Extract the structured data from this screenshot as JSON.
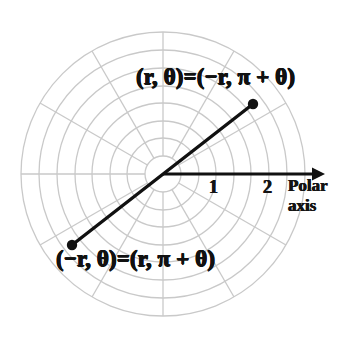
{
  "figure": {
    "background_color": "#ffffff",
    "width": 346,
    "height": 351
  },
  "chart_data": {
    "type": "scatter",
    "subtype": "polar-diagram",
    "title": "",
    "xlabel": "",
    "ylabel": "",
    "grid": true,
    "legend": false,
    "polar_grid": {
      "center_px": [
        163,
        174
      ],
      "circle_count": 8,
      "circle_radii_px": [
        18,
        36,
        53,
        71,
        88,
        106,
        124,
        142
      ],
      "radial_spoke_count": 12,
      "radial_spoke_step_degrees": 30,
      "grid_color": "#c9c9c9",
      "grid_line_width": 1.3
    },
    "axis": {
      "name": "Polar axis",
      "direction_degrees": 0,
      "arrow": true,
      "color": "#111111",
      "origin_px": [
        163,
        174
      ],
      "tip_px": [
        325,
        174
      ],
      "ticks": [
        {
          "label": "1",
          "r_value": 1,
          "x_px": 213
        },
        {
          "label": "2",
          "r_value": 2,
          "x_px": 267
        }
      ]
    },
    "segment": {
      "description": "Line through the pole connecting a point and its negative-radius equivalent",
      "color": "#111111",
      "line_width": 3.4,
      "passes_through_origin": true,
      "endpoints": [
        {
          "id": "upper-point",
          "px": [
            253,
            104
          ],
          "marker": "filled-circle",
          "label": "(r, θ)=(−r, π + θ)",
          "angle_degrees": 35.8,
          "r_value": 2.0
        },
        {
          "id": "lower-point",
          "px": [
            72,
            245
          ],
          "marker": "filled-circle",
          "label": "(−r, θ)=(r, π + θ)",
          "angle_degrees": 215.8,
          "r_value": 2.0
        }
      ]
    },
    "annotations": [
      {
        "id": "upper-equation",
        "text": "(r, θ)=(−r, π + θ)",
        "x_px": 136,
        "y_px": 65
      },
      {
        "id": "lower-equation",
        "text": "(−r, θ)=(r, π + θ)",
        "x_px": 56,
        "y_px": 247
      },
      {
        "id": "axis-name-line1",
        "text": "Polar",
        "x_px": 288,
        "y_px": 176
      },
      {
        "id": "axis-name-line2",
        "text": "axis",
        "x_px": 288,
        "y_px": 196
      }
    ]
  },
  "labels": {
    "upper_equation": "(r, θ)=(−r, π + θ)",
    "lower_equation": "(−r, θ)=(r, π + θ)",
    "tick_one": "1",
    "tick_two": "2",
    "axis_name_line1": "Polar",
    "axis_name_line2": "axis"
  },
  "colors": {
    "ink": "#111111",
    "grid": "#c9c9c9",
    "background": "#ffffff"
  }
}
